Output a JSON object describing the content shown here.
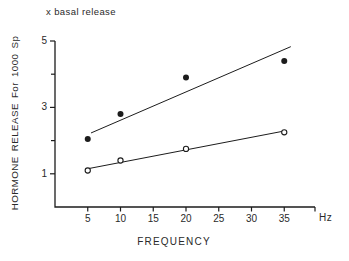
{
  "chart_data": {
    "type": "scatter",
    "annotation": "x basal release",
    "xlabel": "FREQUENCY",
    "x_unit_label": "Hz",
    "ylabel": "HORMONE RELEASE For 1000 Sp",
    "xlim": [
      0,
      39.7
    ],
    "ylim": [
      0,
      5
    ],
    "x_ticks": [
      5,
      10,
      15,
      20,
      25,
      30,
      35
    ],
    "y_ticks_labeled": [
      1,
      3,
      5
    ],
    "y_ticks_minor": [
      2,
      4
    ],
    "grid": "off",
    "legend": "none",
    "axis_color": "#1c1c1c",
    "background_color": "#ffffff",
    "marker_open_fill": "#ffffff",
    "series": [
      {
        "name": "filled-circle-series",
        "marker": "filled-circle",
        "x": [
          5,
          10,
          20,
          35
        ],
        "y": [
          2.05,
          2.8,
          3.9,
          4.4
        ],
        "fit_line": {
          "x1": 5.5,
          "y1": 2.23,
          "x2": 36.0,
          "y2": 4.83
        }
      },
      {
        "name": "open-circle-series",
        "marker": "open-circle",
        "x": [
          5,
          10,
          20,
          35
        ],
        "y": [
          1.1,
          1.4,
          1.75,
          2.25
        ],
        "fit_line": {
          "x1": 5.2,
          "y1": 1.16,
          "x2": 35.3,
          "y2": 2.3
        }
      }
    ]
  }
}
